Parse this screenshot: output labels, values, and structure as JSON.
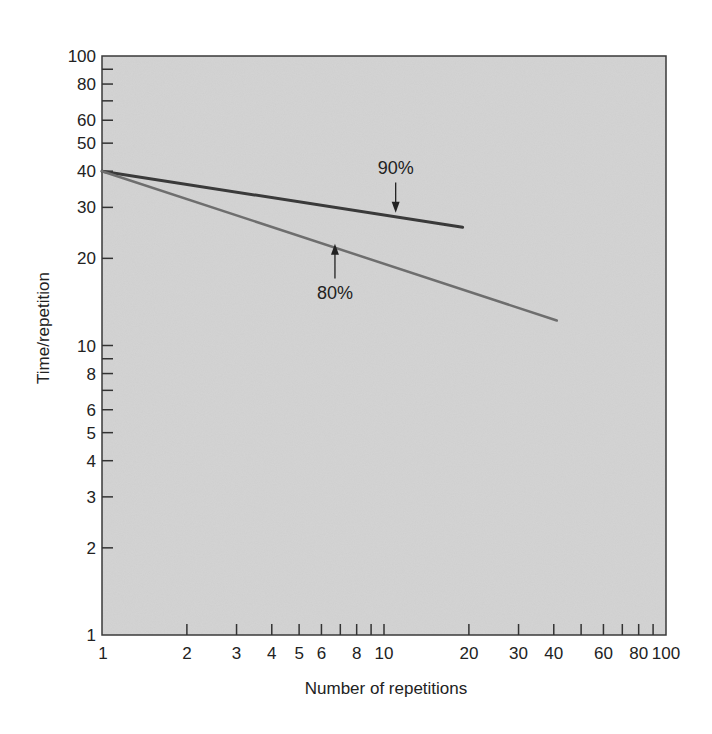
{
  "chart_data": {
    "type": "line",
    "title": "",
    "xlabel": "Number of repetitions",
    "ylabel": "Time/repetition",
    "xscale": "log",
    "yscale": "log",
    "xlim": [
      1,
      100
    ],
    "ylim": [
      1,
      100
    ],
    "grid": false,
    "legend": null,
    "x_ticks": [
      1,
      2,
      3,
      4,
      5,
      6,
      7,
      8,
      9,
      10,
      20,
      30,
      40,
      50,
      60,
      70,
      80,
      90,
      100
    ],
    "x_tick_labels": [
      {
        "value": 1,
        "label": "1"
      },
      {
        "value": 2,
        "label": "2"
      },
      {
        "value": 3,
        "label": "3"
      },
      {
        "value": 4,
        "label": "4"
      },
      {
        "value": 5,
        "label": "5"
      },
      {
        "value": 6,
        "label": "6"
      },
      {
        "value": 8,
        "label": "8"
      },
      {
        "value": 10,
        "label": "10"
      },
      {
        "value": 20,
        "label": "20"
      },
      {
        "value": 30,
        "label": "30"
      },
      {
        "value": 40,
        "label": "40"
      },
      {
        "value": 60,
        "label": "60"
      },
      {
        "value": 80,
        "label": "80"
      },
      {
        "value": 100,
        "label": "100"
      }
    ],
    "y_ticks": [
      1,
      2,
      3,
      4,
      5,
      6,
      7,
      8,
      9,
      10,
      20,
      30,
      40,
      50,
      60,
      70,
      80,
      90,
      100
    ],
    "y_tick_labels": [
      {
        "value": 1,
        "label": "1"
      },
      {
        "value": 2,
        "label": "2"
      },
      {
        "value": 3,
        "label": "3"
      },
      {
        "value": 4,
        "label": "4"
      },
      {
        "value": 5,
        "label": "5"
      },
      {
        "value": 6,
        "label": "6"
      },
      {
        "value": 8,
        "label": "8"
      },
      {
        "value": 10,
        "label": "10"
      },
      {
        "value": 20,
        "label": "20"
      },
      {
        "value": 30,
        "label": "30"
      },
      {
        "value": 40,
        "label": "40"
      },
      {
        "value": 50,
        "label": "50"
      },
      {
        "value": 60,
        "label": "60"
      },
      {
        "value": 80,
        "label": "80"
      },
      {
        "value": 100,
        "label": "100"
      }
    ],
    "series": [
      {
        "name": "90%",
        "color": "#3a3a3a",
        "width": 3,
        "x": [
          1,
          19
        ],
        "y": [
          40,
          25.6
        ]
      },
      {
        "name": "80%",
        "color": "#6e6e6e",
        "width": 2.5,
        "x": [
          1,
          41
        ],
        "y": [
          40,
          12.2
        ]
      }
    ],
    "annotations": [
      {
        "text": "90%",
        "target_series": "90%",
        "arrow": "down",
        "label_x": 11,
        "label_y": 39,
        "arrow_to_x": 11,
        "arrow_to_y": 29
      },
      {
        "text": "80%",
        "target_series": "80%",
        "arrow": "up",
        "label_x": 6.7,
        "label_y": 15.5,
        "arrow_to_x": 6.7,
        "arrow_to_y": 22.3
      }
    ],
    "plot_background": "#cfcfcf"
  }
}
